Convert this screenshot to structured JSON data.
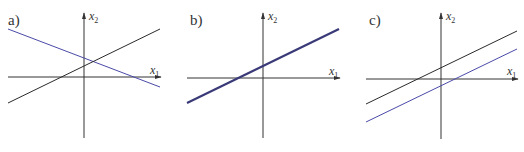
{
  "colors": {
    "axis": "#333333",
    "black_line": "#2a2a2a",
    "blue_line": "#4a4aa8",
    "thick_line": "#3a3a78"
  },
  "panels": [
    {
      "id": "a",
      "label": "a)",
      "x_axis_label": "x",
      "x_axis_sub": "1",
      "y_axis_label": "x",
      "y_axis_sub": "2",
      "description": "Two intersecting lines (one unique solution)"
    },
    {
      "id": "b",
      "label": "b)",
      "x_axis_label": "x",
      "x_axis_sub": "1",
      "y_axis_label": "x",
      "y_axis_sub": "2",
      "description": "Two coincident lines (infinitely many solutions)"
    },
    {
      "id": "c",
      "label": "c)",
      "x_axis_label": "x",
      "x_axis_sub": "1",
      "y_axis_label": "x",
      "y_axis_sub": "2",
      "description": "Two parallel lines (no solution)"
    }
  ]
}
